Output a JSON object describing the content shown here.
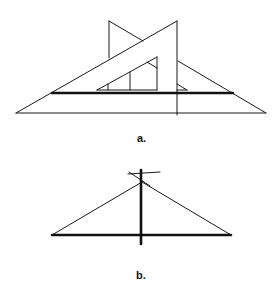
{
  "figures": [
    {
      "id": "a",
      "label": "a.",
      "description": "Two set squares: a 30/60 set square behind a 45 set square resting on a straightedge, used to draw a line"
    },
    {
      "id": "b",
      "label": "b.",
      "description": "Perpendicular bisector construction: triangle over a base line with intersecting arcs at apex and a thick vertical line through it"
    }
  ],
  "colors": {
    "line": "#1a1a1a",
    "background": "#ffffff"
  }
}
